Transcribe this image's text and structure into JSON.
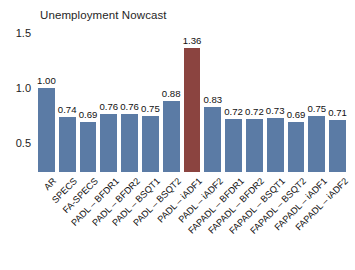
{
  "chart_data": {
    "type": "bar",
    "title": "Unemployment Nowcast",
    "xlabel": "",
    "ylabel": "",
    "ylim": [
      0.35,
      1.55
    ],
    "yticks": [
      "0.5",
      "1.0",
      "1.5"
    ],
    "ytick_values": [
      0.5,
      1.0,
      1.5
    ],
    "grid": false,
    "legend": "none",
    "bar_color": "#5b7ba5",
    "highlight_color": "#8b4440",
    "highlight_index": 7,
    "categories": [
      "AR",
      "SPECS",
      "FA-SPECS",
      "PADL – BFDR1",
      "PADL – BFDR2",
      "PADL – BSQT1",
      "PADL – BSQT2",
      "PADL – iADF1",
      "PADL – iADF2",
      "FAPADL – BFDR1",
      "FAPADL – BFDR2",
      "FAPADL – BSQT1",
      "FAPADL – BSQT2",
      "FAPADL – iADF1",
      "FAPADL – iADF2"
    ],
    "values": [
      1.0,
      0.74,
      0.69,
      0.76,
      0.76,
      0.75,
      0.88,
      1.36,
      0.83,
      0.72,
      0.72,
      0.73,
      0.69,
      0.75,
      0.71
    ],
    "value_labels": [
      "1.00",
      "0.74",
      "0.69",
      "0.76",
      "0.76",
      "0.75",
      "0.88",
      "1.36",
      "0.83",
      "0.72",
      "0.72",
      "0.73",
      "0.69",
      "0.75",
      "0.71"
    ]
  }
}
